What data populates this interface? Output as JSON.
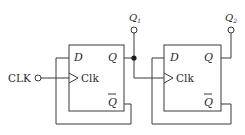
{
  "diagram": {
    "type": "circuit",
    "title": "",
    "input": {
      "label": "CLK"
    },
    "outputs": [
      {
        "label": "Q",
        "subscript": "1"
      },
      {
        "label": "Q",
        "subscript": "2"
      }
    ],
    "flipflops": [
      {
        "name": "FF1",
        "pins": {
          "d": "D",
          "clk": "Clk",
          "q": "Q",
          "qbar": "Q"
        }
      },
      {
        "name": "FF2",
        "pins": {
          "d": "D",
          "clk": "Clk",
          "q": "Q",
          "qbar": "Q"
        }
      }
    ],
    "connections": [
      "CLK -> FF1.Clk",
      "FF1.Qbar -> FF1.D",
      "FF1.Q -> Q1",
      "FF1.Q -> FF2.Clk",
      "FF2.Qbar -> FF2.D",
      "FF2.Q -> Q2"
    ],
    "colors": {
      "line": "#3a3a3a",
      "background": "#ffffff"
    }
  }
}
